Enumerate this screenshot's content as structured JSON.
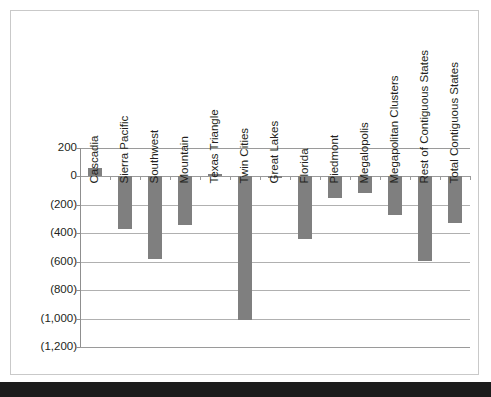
{
  "chart_data": {
    "type": "bar",
    "title": "",
    "xlabel": "",
    "ylabel": "",
    "ylim": [
      -1200,
      200
    ],
    "ytick_step": 200,
    "grid": true,
    "legend": "none",
    "orientation": "vertical",
    "bar_color": "#7f7f7f",
    "negative_format": "parentheses",
    "ytick_labels": [
      "200",
      "0",
      "(200)",
      "(400)",
      "(600)",
      "(800)",
      "(1,000)",
      "(1,200)"
    ],
    "ytick_values": [
      200,
      0,
      -200,
      -400,
      -600,
      -800,
      -1000,
      -1200
    ],
    "categories": [
      "Cascadia",
      "Sierra Pacific",
      "Southwest",
      "Mountain",
      "Texas Triangle",
      "Twin Cities",
      "Great Lakes",
      "Florida",
      "Piedmont",
      "Megalopolis",
      "Megapolitan Clusters",
      "Rest of Contiguous States",
      "Total Contiguous States"
    ],
    "values": [
      58,
      -367,
      -583,
      -339,
      18,
      -1010,
      -4,
      -442,
      -152,
      -120,
      -271,
      -592,
      -328
    ]
  },
  "frame": {
    "border_color": "#c9c9c9",
    "background": "#ffffff"
  }
}
